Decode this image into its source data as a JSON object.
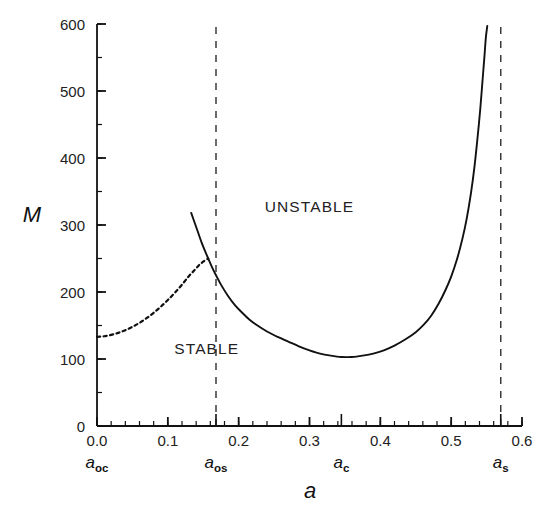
{
  "chart_data": {
    "type": "line",
    "title": "",
    "xlabel": "a",
    "ylabel": "M",
    "xlim": [
      0.0,
      0.6
    ],
    "ylim": [
      0,
      600
    ],
    "grid": false,
    "legend": "none",
    "x_ticks": [
      "0.0",
      "0.1",
      "0.2",
      "0.3",
      "0.4",
      "0.5",
      "0.6"
    ],
    "x_tick_values": [
      0.0,
      0.1,
      0.2,
      0.3,
      0.4,
      0.5,
      0.6
    ],
    "x_minor_step": 0.02,
    "y_ticks": [
      "0",
      "100",
      "200",
      "300",
      "400",
      "500",
      "600"
    ],
    "y_tick_values": [
      0,
      100,
      200,
      300,
      400,
      500,
      600
    ],
    "y_minor_step": 50,
    "annotations": [
      {
        "name": "unstable",
        "text": "UNSTABLE",
        "x": 0.3,
        "y": 320
      },
      {
        "name": "stable",
        "text": "STABLE",
        "x": 0.155,
        "y": 108
      }
    ],
    "critical_points": [
      {
        "name": "a_oc",
        "base": "a",
        "sub": "oc",
        "x": 0.0,
        "tick": false
      },
      {
        "name": "a_os",
        "base": "a",
        "sub": "os",
        "x": 0.168,
        "tick": true
      },
      {
        "name": "a_c",
        "base": "a",
        "sub": "c",
        "x": 0.345,
        "tick": true
      },
      {
        "name": "a_s",
        "base": "a",
        "sub": "s",
        "x": 0.57,
        "tick": true
      }
    ],
    "vertical_dashed_lines": [
      {
        "name": "a_os-line",
        "x": 0.168,
        "y_from": 0,
        "y_to": 600
      },
      {
        "name": "a_s-line",
        "x": 0.57,
        "y_from": 0,
        "y_to": 600
      }
    ],
    "series": [
      {
        "name": "unstable-branch-dashed",
        "style": "dashed",
        "color": "#111111",
        "points": [
          [
            0.0,
            133
          ],
          [
            0.01,
            134
          ],
          [
            0.02,
            136
          ],
          [
            0.03,
            139
          ],
          [
            0.04,
            143
          ],
          [
            0.05,
            148
          ],
          [
            0.06,
            154
          ],
          [
            0.07,
            161
          ],
          [
            0.08,
            169
          ],
          [
            0.09,
            178
          ],
          [
            0.1,
            188
          ],
          [
            0.11,
            199
          ],
          [
            0.12,
            211
          ],
          [
            0.13,
            224
          ],
          [
            0.138,
            233
          ],
          [
            0.145,
            241
          ],
          [
            0.151,
            246
          ],
          [
            0.157,
            250
          ]
        ]
      },
      {
        "name": "stability-boundary-solid",
        "style": "solid",
        "color": "#111111",
        "points": [
          [
            0.133,
            318
          ],
          [
            0.138,
            303
          ],
          [
            0.143,
            288
          ],
          [
            0.148,
            273
          ],
          [
            0.153,
            260
          ],
          [
            0.157,
            250
          ],
          [
            0.162,
            238
          ],
          [
            0.168,
            225
          ],
          [
            0.175,
            211
          ],
          [
            0.185,
            194
          ],
          [
            0.195,
            180
          ],
          [
            0.205,
            169
          ],
          [
            0.215,
            159
          ],
          [
            0.225,
            151
          ],
          [
            0.24,
            141
          ],
          [
            0.255,
            133
          ],
          [
            0.27,
            126
          ],
          [
            0.285,
            119
          ],
          [
            0.3,
            113
          ],
          [
            0.315,
            108
          ],
          [
            0.33,
            105
          ],
          [
            0.345,
            103
          ],
          [
            0.36,
            103
          ],
          [
            0.375,
            105
          ],
          [
            0.39,
            108
          ],
          [
            0.405,
            113
          ],
          [
            0.42,
            120
          ],
          [
            0.435,
            129
          ],
          [
            0.45,
            140
          ],
          [
            0.462,
            152
          ],
          [
            0.472,
            165
          ],
          [
            0.482,
            182
          ],
          [
            0.492,
            203
          ],
          [
            0.5,
            223
          ],
          [
            0.508,
            248
          ],
          [
            0.516,
            280
          ],
          [
            0.522,
            310
          ],
          [
            0.528,
            348
          ],
          [
            0.533,
            388
          ],
          [
            0.537,
            428
          ],
          [
            0.541,
            472
          ],
          [
            0.544,
            512
          ],
          [
            0.547,
            552
          ],
          [
            0.549,
            580
          ],
          [
            0.551,
            597
          ]
        ]
      }
    ]
  }
}
